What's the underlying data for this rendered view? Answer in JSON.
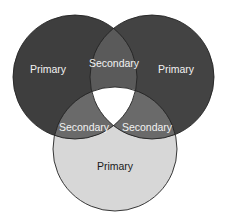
{
  "diagram": {
    "type": "venn",
    "circles": [
      {
        "id": "top-left",
        "label": "Primary",
        "cx": 75,
        "cy": 77,
        "r": 62,
        "fill": "#3e3e3e",
        "text_color": "#f2f2f2",
        "label_x": 48,
        "label_y": 70
      },
      {
        "id": "top-right",
        "label": "Primary",
        "cx": 152,
        "cy": 77,
        "r": 62,
        "fill": "#434343",
        "text_color": "#f2f2f2",
        "label_x": 176,
        "label_y": 70
      },
      {
        "id": "bottom",
        "label": "Primary",
        "cx": 115,
        "cy": 149,
        "r": 62,
        "fill": "#d7d7d7",
        "text_color": "#1a1a1a",
        "label_x": 115,
        "label_y": 167
      }
    ],
    "intersections": [
      {
        "id": "top-left-top-right",
        "label": "Secondary",
        "fill": "#5a5a5a",
        "text_color": "#f2f2f2",
        "label_x": 114,
        "label_y": 64
      },
      {
        "id": "top-left-bottom",
        "label": "Secondary",
        "fill": "#6a6a6a",
        "text_color": "#f2f2f2",
        "label_x": 84,
        "label_y": 128
      },
      {
        "id": "top-right-bottom",
        "label": "Secondary",
        "fill": "#6a6a6a",
        "text_color": "#f2f2f2",
        "label_x": 147,
        "label_y": 128
      }
    ],
    "center": {
      "id": "all-three",
      "label": "",
      "fill": "#ffffff"
    },
    "stroke_color": "#222222"
  }
}
